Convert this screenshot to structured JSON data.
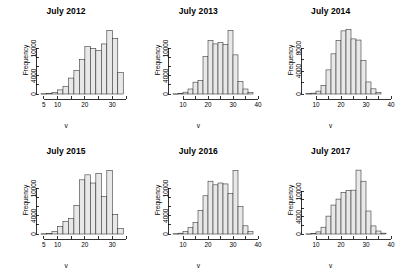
{
  "figure": {
    "panel_count": 6,
    "background_color": "#ffffff",
    "bar_fill_color": "#e8e8e8",
    "bar_border_color": "#2b2b2b"
  },
  "chart_data": [
    {
      "type": "bar",
      "title": "July 2012",
      "xlabel": "v",
      "ylabel": "Frequency",
      "xlim": [
        4,
        35
      ],
      "ylim": [
        0,
        14500
      ],
      "xticks": [
        5,
        10,
        20,
        30
      ],
      "xtick_labels": [
        "5",
        "10",
        "20",
        "30"
      ],
      "xticks_minor": [
        15,
        25,
        35
      ],
      "yticks": [
        0,
        4000,
        10000
      ],
      "ytick_labels": [
        "0",
        "4000",
        "10000"
      ],
      "grid": false,
      "legend": "none",
      "bin_width": 2,
      "bin_starts": [
        4,
        6,
        8,
        10,
        12,
        14,
        16,
        18,
        20,
        22,
        24,
        26,
        28,
        30,
        32
      ],
      "values": [
        60,
        120,
        350,
        900,
        1700,
        3500,
        5200,
        7600,
        10400,
        10000,
        9600,
        11000,
        14000,
        12200,
        4700
      ],
      "categories": [
        "4-6",
        "6-8",
        "8-10",
        "10-12",
        "12-14",
        "14-16",
        "16-18",
        "18-20",
        "20-22",
        "22-24",
        "24-26",
        "26-28",
        "28-30",
        "30-32",
        "32-34"
      ]
    },
    {
      "type": "bar",
      "title": "July 2013",
      "xlabel": "v",
      "ylabel": "Frequency",
      "xlim": [
        6,
        40
      ],
      "ylim": [
        0,
        14500
      ],
      "xticks": [
        10,
        20,
        30,
        40
      ],
      "xtick_labels": [
        "10",
        "20",
        "30",
        "40"
      ],
      "xticks_minor": [],
      "yticks": [
        0,
        4000,
        10000
      ],
      "ytick_labels": [
        "0",
        "4000",
        "10000"
      ],
      "grid": false,
      "legend": "none",
      "bin_width": 2,
      "bin_starts": [
        6,
        8,
        10,
        12,
        14,
        16,
        18,
        20,
        22,
        24,
        26,
        28,
        30,
        32,
        34,
        36
      ],
      "values": [
        40,
        120,
        400,
        1100,
        2600,
        3000,
        8200,
        11800,
        11000,
        11300,
        10900,
        14000,
        8600,
        2700,
        1100,
        300
      ],
      "categories": [
        "6-8",
        "8-10",
        "10-12",
        "12-14",
        "14-16",
        "16-18",
        "18-20",
        "20-22",
        "22-24",
        "24-26",
        "26-28",
        "28-30",
        "30-32",
        "32-34",
        "34-36",
        "36-38"
      ]
    },
    {
      "type": "bar",
      "title": "July 2014",
      "xlabel": "v",
      "ylabel": "Frequency",
      "xlim": [
        6,
        40
      ],
      "ylim": [
        0,
        11500
      ],
      "xticks": [
        10,
        20,
        30,
        40
      ],
      "xtick_labels": [
        "10",
        "20",
        "30",
        "40"
      ],
      "xticks_minor": [],
      "yticks": [
        0,
        4000,
        8000
      ],
      "ytick_labels": [
        "0",
        "4000",
        "8000"
      ],
      "grid": false,
      "legend": "none",
      "bin_width": 2,
      "bin_starts": [
        6,
        8,
        10,
        12,
        14,
        16,
        18,
        20,
        22,
        24,
        26,
        28,
        30,
        32,
        34
      ],
      "values": [
        50,
        150,
        500,
        1500,
        4200,
        7000,
        9300,
        11000,
        11200,
        9600,
        9400,
        5800,
        2100,
        900,
        250
      ],
      "categories": [
        "6-8",
        "8-10",
        "10-12",
        "12-14",
        "14-16",
        "16-18",
        "18-20",
        "20-22",
        "22-24",
        "24-26",
        "26-28",
        "28-30",
        "30-32",
        "32-34",
        "34-36"
      ]
    },
    {
      "type": "bar",
      "title": "July 2015",
      "xlabel": "v",
      "ylabel": "Frequency",
      "xlim": [
        4,
        35
      ],
      "ylim": [
        0,
        14500
      ],
      "xticks": [
        5,
        10,
        20,
        30
      ],
      "xtick_labels": [
        "5",
        "10",
        "20",
        "30"
      ],
      "xticks_minor": [
        15,
        25,
        35
      ],
      "yticks": [
        0,
        4000,
        10000
      ],
      "ytick_labels": [
        "0",
        "4000",
        "10000"
      ],
      "grid": false,
      "legend": "none",
      "bin_width": 2,
      "bin_starts": [
        4,
        6,
        8,
        10,
        12,
        14,
        16,
        18,
        20,
        22,
        24,
        26,
        28,
        30,
        32
      ],
      "values": [
        50,
        150,
        600,
        1600,
        2800,
        3400,
        6300,
        11900,
        13000,
        11200,
        13300,
        8200,
        14000,
        4300,
        1200
      ],
      "categories": [
        "4-6",
        "6-8",
        "8-10",
        "10-12",
        "12-14",
        "14-16",
        "16-18",
        "18-20",
        "20-22",
        "22-24",
        "24-26",
        "26-28",
        "28-30",
        "30-32",
        "32-34"
      ]
    },
    {
      "type": "bar",
      "title": "July 2016",
      "xlabel": "v",
      "ylabel": "Frequency",
      "xlim": [
        6,
        40
      ],
      "ylim": [
        0,
        14500
      ],
      "xticks": [
        10,
        20,
        30,
        40
      ],
      "xtick_labels": [
        "10",
        "20",
        "30",
        "40"
      ],
      "xticks_minor": [],
      "yticks": [
        0,
        4000,
        10000
      ],
      "ytick_labels": [
        "0",
        "4000",
        "10000"
      ],
      "grid": false,
      "legend": "none",
      "bin_width": 2,
      "bin_starts": [
        6,
        8,
        10,
        12,
        14,
        16,
        18,
        20,
        22,
        24,
        26,
        28,
        30,
        32,
        34,
        36
      ],
      "values": [
        60,
        180,
        600,
        1400,
        2500,
        5200,
        8400,
        11600,
        10800,
        11200,
        11000,
        8900,
        14000,
        6000,
        1800,
        500
      ],
      "categories": [
        "6-8",
        "8-10",
        "10-12",
        "12-14",
        "14-16",
        "16-18",
        "18-20",
        "20-22",
        "22-24",
        "24-26",
        "26-28",
        "28-30",
        "30-32",
        "32-34",
        "34-36",
        "36-38"
      ]
    },
    {
      "type": "bar",
      "title": "July 2017",
      "xlabel": "v",
      "ylabel": "Frequency",
      "xlim": [
        6,
        40
      ],
      "ylim": [
        0,
        15500
      ],
      "xticks": [
        10,
        20,
        30,
        40
      ],
      "xtick_labels": [
        "10",
        "20",
        "30",
        "40"
      ],
      "xticks_minor": [],
      "yticks": [
        0,
        4000,
        10000
      ],
      "ytick_labels": [
        "0",
        "4000",
        "10000"
      ],
      "grid": false,
      "legend": "none",
      "bin_width": 2,
      "bin_starts": [
        6,
        8,
        10,
        12,
        14,
        16,
        18,
        20,
        22,
        24,
        26,
        28,
        30,
        32,
        34,
        36
      ],
      "values": [
        40,
        130,
        500,
        1600,
        4200,
        6800,
        8200,
        9800,
        10200,
        10300,
        15000,
        12400,
        5400,
        1900,
        700,
        200
      ],
      "categories": [
        "6-8",
        "8-10",
        "10-12",
        "12-14",
        "14-16",
        "16-18",
        "18-20",
        "20-22",
        "22-24",
        "24-26",
        "26-28",
        "28-30",
        "30-32",
        "32-34",
        "34-36",
        "36-38"
      ]
    }
  ]
}
